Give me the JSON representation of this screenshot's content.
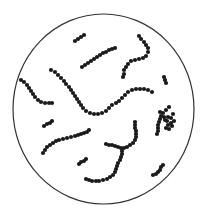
{
  "diagram": {
    "type": "microscope-field",
    "colors": {
      "background": "#ffffff",
      "outline": "#333333",
      "cell": "#1a1a1a"
    },
    "field": {
      "cx": 103.5,
      "cy": 109,
      "rx": 90.5,
      "ry": 95
    },
    "cell_radius": 2.1,
    "chains": [
      {
        "name": "chain-top-short",
        "points": [
          [
            75,
            41
          ],
          [
            78,
            39
          ],
          [
            81,
            37
          ],
          [
            84,
            35
          ]
        ]
      },
      {
        "name": "chain-top-diagonal",
        "points": [
          [
            82,
            67
          ],
          [
            85,
            65
          ],
          [
            88,
            63
          ],
          [
            91,
            61
          ],
          [
            94,
            59
          ],
          [
            97,
            57
          ],
          [
            100,
            55
          ],
          [
            103,
            53
          ],
          [
            106,
            52
          ],
          [
            109,
            50
          ],
          [
            112,
            49
          ],
          [
            115,
            48
          ]
        ]
      },
      {
        "name": "chain-top-right-hook",
        "points": [
          [
            139,
            36
          ],
          [
            141,
            39
          ],
          [
            144,
            42
          ],
          [
            146,
            45
          ],
          [
            148,
            48
          ],
          [
            148,
            52
          ],
          [
            146,
            56
          ],
          [
            143,
            58
          ],
          [
            139,
            59
          ],
          [
            135,
            60
          ],
          [
            131,
            61
          ],
          [
            128,
            64
          ],
          [
            126,
            67
          ],
          [
            124,
            70
          ],
          [
            124,
            74
          ],
          [
            123,
            77
          ]
        ]
      },
      {
        "name": "chain-right-pair",
        "points": [
          [
            164,
            77
          ],
          [
            165,
            80
          ],
          [
            166,
            83
          ]
        ]
      },
      {
        "name": "chain-left-curve",
        "points": [
          [
            21,
            80
          ],
          [
            24,
            82
          ],
          [
            27,
            85
          ],
          [
            29,
            88
          ],
          [
            31,
            91
          ],
          [
            33,
            94
          ],
          [
            35,
            97
          ],
          [
            38,
            100
          ],
          [
            41,
            102
          ],
          [
            45,
            103
          ],
          [
            49,
            103
          ],
          [
            52,
            103
          ]
        ]
      },
      {
        "name": "chain-central-long",
        "points": [
          [
            51,
            70
          ],
          [
            55,
            72
          ],
          [
            58,
            75
          ],
          [
            61,
            78
          ],
          [
            64,
            81
          ],
          [
            66,
            84
          ],
          [
            69,
            87
          ],
          [
            71,
            90
          ],
          [
            73,
            93
          ],
          [
            75,
            96
          ],
          [
            77,
            99
          ],
          [
            79,
            102
          ],
          [
            81,
            105
          ],
          [
            83,
            108
          ],
          [
            86,
            111
          ],
          [
            90,
            113
          ],
          [
            94,
            114
          ],
          [
            98,
            114
          ],
          [
            102,
            113
          ],
          [
            106,
            111
          ],
          [
            109,
            108
          ],
          [
            112,
            105
          ],
          [
            116,
            103
          ],
          [
            119,
            101
          ],
          [
            122,
            98
          ],
          [
            125,
            95
          ],
          [
            128,
            92
          ],
          [
            132,
            90
          ],
          [
            136,
            89
          ],
          [
            140,
            89
          ],
          [
            144,
            89
          ],
          [
            148,
            90
          ],
          [
            152,
            92
          ]
        ]
      },
      {
        "name": "chain-left-short",
        "points": [
          [
            44,
            126
          ],
          [
            47,
            124
          ],
          [
            50,
            123
          ],
          [
            52,
            121
          ]
        ]
      },
      {
        "name": "chain-left-middle-diagonal",
        "points": [
          [
            43,
            153
          ],
          [
            45,
            150
          ],
          [
            47,
            147
          ],
          [
            50,
            145
          ],
          [
            53,
            143
          ],
          [
            56,
            141
          ],
          [
            59,
            140
          ],
          [
            63,
            139
          ],
          [
            67,
            138
          ],
          [
            71,
            137
          ],
          [
            75,
            136
          ],
          [
            78,
            135
          ],
          [
            81,
            134
          ],
          [
            84,
            133
          ],
          [
            87,
            132
          ],
          [
            89,
            130
          ]
        ]
      },
      {
        "name": "chain-center-hook",
        "points": [
          [
            135,
            122
          ],
          [
            135,
            125
          ],
          [
            135,
            128
          ],
          [
            136,
            131
          ],
          [
            136,
            134
          ],
          [
            136,
            137
          ],
          [
            135,
            140
          ],
          [
            133,
            143
          ],
          [
            130,
            145
          ],
          [
            127,
            147
          ],
          [
            124,
            148
          ],
          [
            121,
            148
          ],
          [
            118,
            147
          ],
          [
            115,
            146
          ],
          [
            112,
            145
          ],
          [
            109,
            145
          ],
          [
            106,
            144
          ]
        ]
      },
      {
        "name": "chain-right-cluster",
        "points": [
          [
            169,
            107
          ],
          [
            166,
            110
          ],
          [
            163,
            113
          ],
          [
            161,
            116
          ],
          [
            160,
            119
          ],
          [
            159,
            122
          ],
          [
            158,
            125
          ],
          [
            158,
            128
          ],
          [
            158,
            131
          ],
          [
            157,
            134
          ],
          [
            160,
            112
          ],
          [
            164,
            117
          ],
          [
            165,
            120
          ],
          [
            168,
            117
          ],
          [
            171,
            118
          ],
          [
            174,
            121
          ],
          [
            171,
            123
          ],
          [
            168,
            125
          ],
          [
            166,
            128
          ],
          [
            169,
            129
          ],
          [
            172,
            126
          ],
          [
            173,
            114
          ],
          [
            167,
            121
          ]
        ]
      },
      {
        "name": "chain-bottom-left-short",
        "points": [
          [
            79,
            164
          ],
          [
            81,
            162
          ],
          [
            84,
            161
          ],
          [
            86,
            159
          ]
        ]
      },
      {
        "name": "chain-bottom-j",
        "points": [
          [
            86,
            179
          ],
          [
            89,
            180
          ],
          [
            92,
            181
          ],
          [
            96,
            181
          ],
          [
            99,
            181
          ],
          [
            103,
            180
          ],
          [
            107,
            179
          ],
          [
            110,
            177
          ],
          [
            113,
            175
          ],
          [
            115,
            172
          ],
          [
            116,
            169
          ],
          [
            117,
            166
          ],
          [
            118,
            163
          ],
          [
            120,
            160
          ],
          [
            121,
            157
          ],
          [
            122,
            154
          ],
          [
            122,
            151
          ]
        ]
      },
      {
        "name": "chain-bottom-right-short",
        "points": [
          [
            153,
            175
          ],
          [
            156,
            174
          ],
          [
            158,
            172
          ],
          [
            160,
            170
          ],
          [
            161,
            167
          ],
          [
            163,
            165
          ]
        ]
      }
    ]
  }
}
